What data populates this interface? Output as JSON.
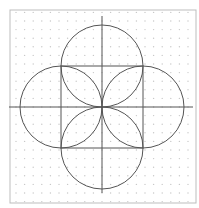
{
  "diagram": {
    "title": "",
    "colors": {
      "background": "#ffffff",
      "frame": "#bdbdbd",
      "grid_dot": "#c8c8c8",
      "stroke": "#555555"
    },
    "shapes": {
      "square": {
        "side_units": 2
      },
      "circles": [
        {
          "name": "top",
          "center_units": [
            0,
            1
          ],
          "radius_units": 1
        },
        {
          "name": "bottom",
          "center_units": [
            0,
            -1
          ],
          "radius_units": 1
        },
        {
          "name": "left",
          "center_units": [
            -1,
            0
          ],
          "radius_units": 1
        },
        {
          "name": "right",
          "center_units": [
            1,
            0
          ],
          "radius_units": 1
        }
      ],
      "axes": [
        "horizontal",
        "vertical"
      ]
    }
  }
}
